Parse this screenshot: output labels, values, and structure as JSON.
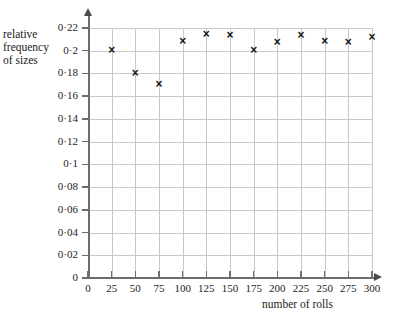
{
  "chart_data": {
    "type": "scatter",
    "title": "",
    "xlabel": "number of rolls",
    "ylabel_lines": [
      "relative",
      "frequency",
      "of sizes"
    ],
    "ylabel": "relative frequency of sizes",
    "x": [
      25,
      50,
      75,
      100,
      125,
      150,
      175,
      200,
      225,
      250,
      275,
      300
    ],
    "values": [
      0.2,
      0.18,
      0.17,
      0.208,
      0.214,
      0.213,
      0.2,
      0.207,
      0.213,
      0.208,
      0.207,
      0.212
    ],
    "xlim": [
      0,
      300
    ],
    "ylim": [
      0,
      0.22
    ],
    "xticks": [
      0,
      25,
      50,
      75,
      100,
      125,
      150,
      175,
      200,
      225,
      250,
      275,
      300
    ],
    "xtick_labels": [
      "0",
      "25",
      "50",
      "75",
      "100",
      "125",
      "150",
      "175",
      "200",
      "225",
      "250",
      "275",
      "300"
    ],
    "yticks": [
      0,
      0.02,
      0.04,
      0.06,
      0.08,
      0.1,
      0.12,
      0.14,
      0.16,
      0.18,
      0.2,
      0.22
    ],
    "ytick_labels": [
      "0",
      "0·02",
      "0·04",
      "0·06",
      "0·08",
      "0·1",
      "0·12",
      "0·14",
      "0·16",
      "0·18",
      "0·2",
      "0·22"
    ],
    "grid": true,
    "legend": null,
    "marker": "cross",
    "colors": {
      "marker": "#151515",
      "grid": "#c8c8c8",
      "axis": "#6d6d6d",
      "text": "#1b1b1b",
      "background": "#ffffff"
    }
  }
}
